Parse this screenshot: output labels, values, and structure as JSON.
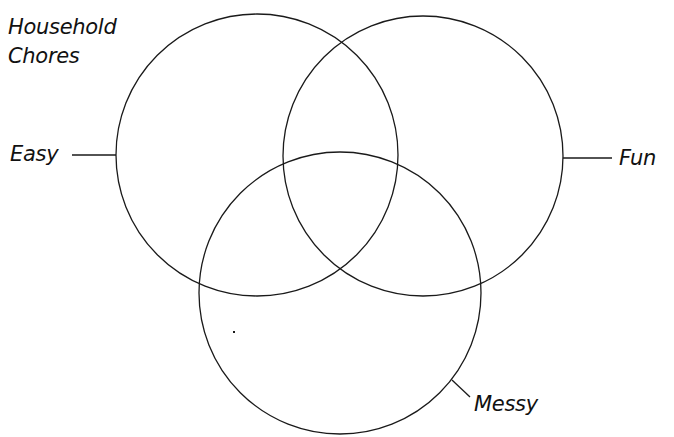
{
  "diagram": {
    "type": "venn",
    "title_lines": [
      "Household",
      "Chores"
    ],
    "sets": [
      {
        "id": "easy",
        "label": "Easy",
        "cx": 257,
        "cy": 155,
        "r": 141
      },
      {
        "id": "fun",
        "label": "Fun",
        "cx": 423,
        "cy": 156,
        "r": 140
      },
      {
        "id": "messy",
        "label": "Messy",
        "cx": 340,
        "cy": 293,
        "r": 141
      }
    ],
    "stroke_color": "#1a1a1a",
    "background_color": "#ffffff"
  }
}
